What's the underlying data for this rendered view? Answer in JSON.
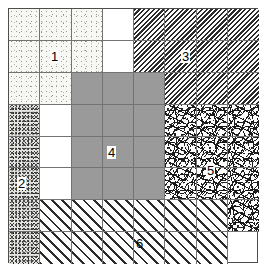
{
  "figure": {
    "type": "grid-map",
    "grid": {
      "columns": 8,
      "rows": 8,
      "cell_width": 31.25,
      "cell_height": 31.875
    },
    "colors": {
      "outer_border": "#4d4d4d",
      "grid_line": "#737373",
      "solid_gray_fill": "#9a9a9a",
      "background": "#ffffff",
      "ink": "#000000"
    },
    "regions": [
      {
        "id": "1",
        "label": "1",
        "texture": "light-sparse-stipple",
        "col_start": 1,
        "col_end": 3,
        "row_start": 1,
        "row_end": 3,
        "label_col": 2,
        "label_row": 2
      },
      {
        "id": "2",
        "label": "2",
        "texture": "dense-dark-stipple",
        "col_start": 1,
        "col_end": 1,
        "row_start": 4,
        "row_end": 8,
        "label_col": 1,
        "label_row": 6
      },
      {
        "id": "3",
        "label": "3",
        "texture": "dense-backslash-hatch",
        "col_start": 5,
        "col_end": 8,
        "row_start": 1,
        "row_end": 3,
        "label_col": 6,
        "label_row": 2
      },
      {
        "id": "4",
        "label": "4",
        "texture": "solid-gray",
        "col_start": 3,
        "col_end": 5,
        "row_start": 3,
        "row_end": 7,
        "label_col": 4,
        "label_row": 5
      },
      {
        "id": "5",
        "label": "5",
        "texture": "squiggle",
        "col_start": 6,
        "col_end": 8,
        "row_start": 4,
        "row_end": 7,
        "label_col": 7,
        "label_row": 6
      },
      {
        "id": "6",
        "label": "6",
        "texture": "wide-slash-hatch",
        "col_start": 2,
        "col_end": 7,
        "row_start": 7,
        "row_end": 8,
        "label_col": 4,
        "label_row": 7
      }
    ]
  }
}
